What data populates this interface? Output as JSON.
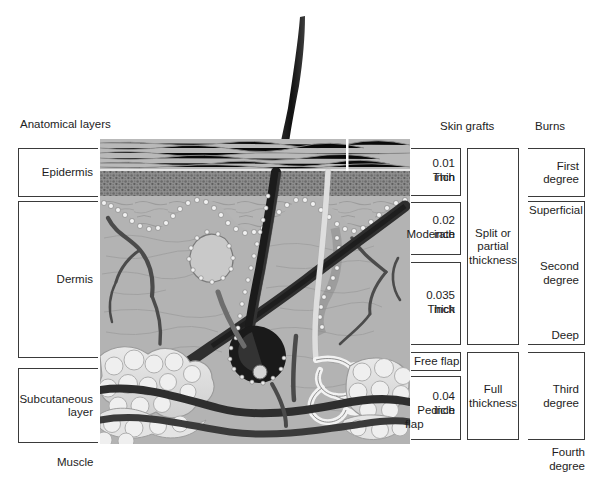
{
  "figure": {
    "type": "labeled-anatomical-diagram"
  },
  "headers": {
    "anatomical": "Anatomical layers",
    "skin_grafts": "Skin grafts",
    "burns": "Burns"
  },
  "anatomical_layers": [
    {
      "label": "Epidermis"
    },
    {
      "label": "Dermis"
    },
    {
      "label": "Subcutaneous\nlayer"
    }
  ],
  "muscle_label": "Muscle",
  "skin_grafts": {
    "depths": [
      {
        "thickness": "0.01 inch",
        "grade": "Thin"
      },
      {
        "thickness": "0.02 inch",
        "grade": "Moderate"
      },
      {
        "thickness": "0.035 inch",
        "grade": "Thick"
      }
    ],
    "free_flap": "Free flap",
    "pedicle": {
      "thickness": "0.04 inch",
      "grade": "Pedicle",
      "grade2": "flap"
    },
    "groups": [
      {
        "label": "Split or\npartial\nthickness"
      },
      {
        "label": "Full\nthickness"
      }
    ]
  },
  "burns": {
    "first": "First\ndegree",
    "second": "Second\ndegree",
    "second_top": "Superficial",
    "second_bottom": "Deep",
    "third": "Third\ndegree",
    "fourth": "Fourth\ndegree"
  },
  "illustration": {
    "name": "skin-cross-section",
    "features": [
      "hair-shaft",
      "epidermis-stratum-corneum",
      "granular-layer",
      "dermal-papillae",
      "hair-follicle",
      "sebaceous-gland",
      "arrector-pili-muscle",
      "sweat-gland-duct",
      "eccrine-sweat-gland",
      "blood-vessels",
      "subcutaneous-fat-lobules"
    ]
  },
  "colors": {
    "line": "#3a3a3a",
    "text": "#1d1d1d",
    "background": "#ffffff"
  }
}
